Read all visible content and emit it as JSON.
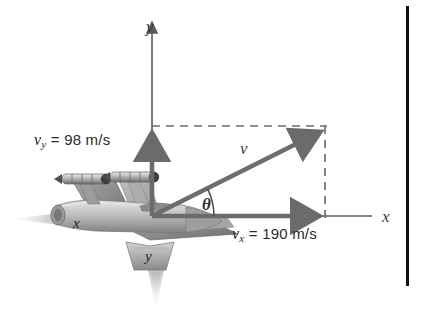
{
  "figure": {
    "kind": "physics-vector-diagram",
    "background_color": "#ffffff"
  },
  "axes": {
    "x_label": "x",
    "y_label": "y",
    "origin": {
      "x": 152,
      "y": 216
    },
    "x_axis_end": {
      "x": 372,
      "y": 216
    },
    "y_axis_top": {
      "x": 152,
      "y": 22
    },
    "color": "#5a5a5a"
  },
  "vectors": {
    "resultant": {
      "label": "v",
      "color": "#6b6b6b",
      "from": {
        "x": 152,
        "y": 216
      },
      "to": {
        "x": 325,
        "y": 130
      },
      "label_pos": {
        "x": 238,
        "y": 140
      }
    },
    "x_component": {
      "label_value": "190",
      "label_units": "m/s",
      "symbol": "v",
      "subscript": "x",
      "full_label": "v_x = 190 m/s",
      "color": "#6b6b6b",
      "from": {
        "x": 152,
        "y": 216
      },
      "to": {
        "x": 325,
        "y": 216
      },
      "label_pos": {
        "x": 232,
        "y": 230
      }
    },
    "y_component": {
      "label_value": "98",
      "label_units": "m/s",
      "symbol": "v",
      "subscript": "y",
      "full_label": "v_y = 98 m/s",
      "color": "#6b6b6b",
      "from": {
        "x": 152,
        "y": 216
      },
      "to": {
        "x": 152,
        "y": 128
      },
      "label_pos": {
        "x": 36,
        "y": 139
      }
    }
  },
  "angle": {
    "label": "θ",
    "label_pos": {
      "x": 205,
      "y": 198
    },
    "arc_radius": 62,
    "color": "#4a4a4a"
  },
  "guides": {
    "dash_color": "#6e6e6e",
    "horizontal": {
      "x1": 152,
      "y1": 126,
      "x2": 325,
      "y2": 126
    },
    "vertical": {
      "x1": 325,
      "y1": 126,
      "x2": 325,
      "y2": 218
    }
  },
  "aircraft": {
    "name": "fighter-jet",
    "fuselage_letter": "x",
    "tailfin_letter": "y",
    "body_color": "#b9b9b9",
    "wing_color": "#8f8f8f",
    "shadow_color": "#6f6f6f",
    "exhaust_color": "#cfcfcf",
    "missiles": 2
  },
  "border": {
    "present": true,
    "color": "#111111",
    "x": 406,
    "y_top": 6,
    "y_bottom": 286,
    "width": 3
  }
}
